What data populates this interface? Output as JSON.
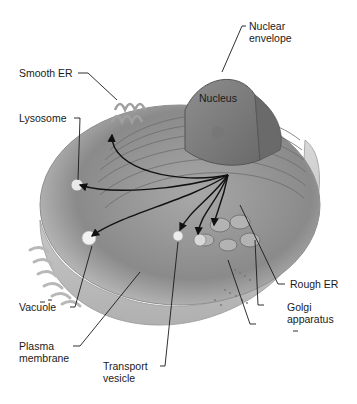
{
  "diagram": {
    "labels": {
      "nuclear_envelope": [
        "Nuclear",
        "envelope"
      ],
      "smooth_er": "Smooth ER",
      "nucleus": "Nucleus",
      "lysosome": "Lysosome",
      "rough_er": "Rough ER",
      "vacuole": "Vacuole",
      "golgi": [
        "Golgi",
        "apparatus"
      ],
      "plasma_membrane": [
        "Plasma",
        "membrane"
      ],
      "transport_vesicle": [
        "Transport",
        "vesicle"
      ]
    },
    "colors": {
      "background": "#ffffff",
      "cell_body": "#9a9a9a",
      "cell_light": "#c8c8c8",
      "nucleus": "#7d7d7d",
      "leader_line": "#1a1a1a",
      "arrow": "#111111"
    }
  }
}
